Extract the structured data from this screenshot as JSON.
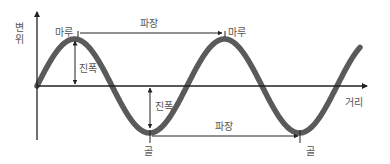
{
  "diagram": {
    "title": "",
    "y_axis_label": [
      "변",
      "위"
    ],
    "x_axis_label": "거리",
    "labels": {
      "crest_1": "마루",
      "crest_2": "마루",
      "trough_1": "골",
      "trough_2": "골",
      "wavelength_top": "파장",
      "wavelength_bottom": "파장",
      "amplitude_top": "진폭",
      "amplitude_bottom": "진폭"
    },
    "colors": {
      "wave": "#5a5a5a",
      "axis": "#222222",
      "text": "#555555"
    },
    "wave": {
      "type": "sine",
      "start_x": 37,
      "baseline_y": 86,
      "wavelength_px": 150,
      "amplitude_px": 47,
      "end_x": 360
    }
  }
}
